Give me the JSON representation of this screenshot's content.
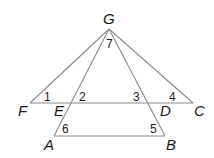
{
  "diagram": {
    "points": {
      "G": {
        "label": "G",
        "x": 109,
        "y": 29
      },
      "F": {
        "label": "F",
        "x": 30,
        "y": 103
      },
      "E": {
        "label": "E",
        "x": 72,
        "y": 103
      },
      "D": {
        "label": "D",
        "x": 152,
        "y": 103
      },
      "C": {
        "label": "C",
        "x": 193,
        "y": 103
      },
      "A": {
        "label": "A",
        "x": 54,
        "y": 136
      },
      "B": {
        "label": "B",
        "x": 165,
        "y": 136
      }
    },
    "segments": [
      [
        "G",
        "F"
      ],
      [
        "G",
        "C"
      ],
      [
        "G",
        "A"
      ],
      [
        "G",
        "B"
      ],
      [
        "F",
        "C"
      ],
      [
        "A",
        "B"
      ]
    ],
    "angles": {
      "a1": "1",
      "a2": "2",
      "a3": "3",
      "a4": "4",
      "a5": "5",
      "a6": "6",
      "a7": "7"
    }
  }
}
